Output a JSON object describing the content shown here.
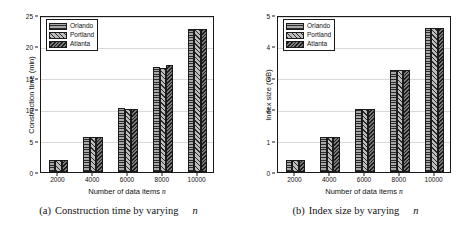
{
  "figure": {
    "panels": [
      {
        "id": "panel-a",
        "caption_tag": "(a)",
        "caption_text": "Construction time by varying",
        "caption_var": "n",
        "legend": [
          {
            "label": "Orlando",
            "pattern": "horizontal-lines"
          },
          {
            "label": "Portland",
            "pattern": "diagonal-hatch"
          },
          {
            "label": "Atlanta",
            "pattern": "dense-reverse-hatch"
          }
        ],
        "chart_data": {
          "type": "bar",
          "title": "",
          "xlabel": "Number of data items n",
          "ylabel": "Construction time (min)",
          "categories": [
            "2000",
            "4000",
            "6000",
            "8000",
            "10000"
          ],
          "xtick_labels": [
            "2000",
            "4000",
            "6000",
            "8000",
            "10000"
          ],
          "ytick_labels": [
            "0",
            "5",
            "10",
            "15",
            "20",
            "25"
          ],
          "ylim": [
            0,
            25
          ],
          "ytick_step": 5,
          "grid": "horizontal",
          "legend_position": "top-left",
          "series": [
            {
              "name": "Orlando",
              "values": [
                1.85,
                5.55,
                10.25,
                16.8,
                22.8
              ]
            },
            {
              "name": "Portland",
              "values": [
                1.85,
                5.55,
                10.1,
                16.5,
                22.8
              ]
            },
            {
              "name": "Atlanta",
              "values": [
                1.85,
                5.6,
                10.1,
                17.0,
                22.8
              ]
            }
          ]
        }
      },
      {
        "id": "panel-b",
        "caption_tag": "(b)",
        "caption_text": "Index size by varying",
        "caption_var": "n",
        "legend": [
          {
            "label": "Orlando",
            "pattern": "horizontal-lines"
          },
          {
            "label": "Portland",
            "pattern": "diagonal-hatch"
          },
          {
            "label": "Atlanta",
            "pattern": "dense-reverse-hatch"
          }
        ],
        "chart_data": {
          "type": "bar",
          "title": "",
          "xlabel": "Number of data items n",
          "ylabel": "Index size (GB)",
          "categories": [
            "2000",
            "4000",
            "6000",
            "8000",
            "10000"
          ],
          "xtick_labels": [
            "2000",
            "4000",
            "6000",
            "8000",
            "10000"
          ],
          "ytick_labels": [
            "0",
            "1",
            "2",
            "3",
            "4",
            "5"
          ],
          "ylim": [
            0,
            5
          ],
          "ytick_step": 1,
          "grid": "horizontal",
          "legend_position": "top-left",
          "series": [
            {
              "name": "Orlando",
              "values": [
                0.37,
                1.1,
                2.0,
                3.25,
                4.6
              ]
            },
            {
              "name": "Portland",
              "values": [
                0.37,
                1.1,
                2.0,
                3.25,
                4.6
              ]
            },
            {
              "name": "Atlanta",
              "values": [
                0.37,
                1.1,
                2.02,
                3.25,
                4.6
              ]
            }
          ]
        }
      }
    ],
    "colors": {
      "axis": "#1a1a1a",
      "grid": "#d9d9d9",
      "background": "#ffffff",
      "orlando": "#7d7d7d",
      "portland": "#8a8a8a",
      "atlanta": "#555555"
    }
  }
}
